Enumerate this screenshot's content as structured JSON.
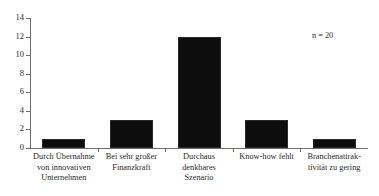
{
  "chart_data": {
    "type": "bar",
    "title": "",
    "subtitle": "",
    "xlabel": "",
    "ylabel": "",
    "categories": [
      "Durch Übernahme von innovativen Unternehmen",
      "Bei sehr großer Finanzkraft",
      "Durchaus denkbares Szenario",
      "Know-how fehlt",
      "Branchenattraktivität zu gering"
    ],
    "category_lines": [
      [
        "Durch Übernahme",
        "von innovativen",
        "Unternehmen"
      ],
      [
        "Bei sehr großer",
        "Finanzkraft"
      ],
      [
        "Durchaus",
        "denkbares",
        "Szenario"
      ],
      [
        "Know-how fehlt"
      ],
      [
        "Branchenattrak-",
        "tivität zu gering"
      ]
    ],
    "values": [
      1,
      3,
      12,
      3,
      1
    ],
    "ylim": [
      0,
      14
    ],
    "ytick_values": [
      0,
      2,
      4,
      6,
      8,
      10,
      12,
      14
    ],
    "ytick_labels": [
      "0",
      "2",
      "4",
      "6",
      "8",
      "10",
      "12",
      "14"
    ],
    "grid": false,
    "legend": false,
    "legend_position": "none",
    "annotations": [
      {
        "text": "n = 20",
        "x_px": 312,
        "y_px": 30
      }
    ],
    "bar_color": "#0d0d0d",
    "axis_color": "#6d6d6d",
    "background_color": "#ffffff"
  }
}
